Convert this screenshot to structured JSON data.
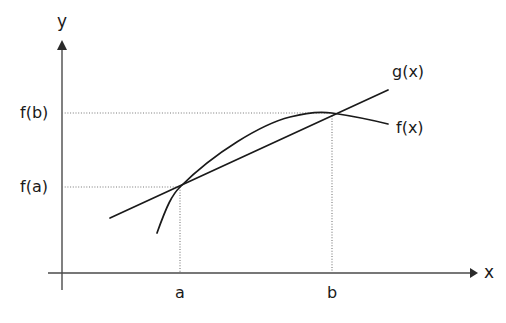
{
  "figure": {
    "background_color": "#ffffff",
    "line_color": "#1a1a1a",
    "axis_color": "#4a4a4a",
    "guide_color": "#787878"
  },
  "axes": {
    "x_label": "x",
    "y_label": "y",
    "x_axis": {
      "y": 273,
      "x_start": 48,
      "x_end": 478
    },
    "y_axis": {
      "x": 62,
      "y_start": 42,
      "y_end": 290
    }
  },
  "ticks": [
    {
      "name": "a",
      "label": "a",
      "x": 180,
      "label_x": 175,
      "label_y": 285
    },
    {
      "name": "b",
      "label": "b",
      "x": 332,
      "label_x": 327,
      "label_y": 285
    }
  ],
  "value_labels": [
    {
      "name": "f-of-a",
      "label": "f(a)",
      "y": 187,
      "label_x": 20,
      "label_y": 179
    },
    {
      "name": "f-of-b",
      "label": "f(b)",
      "y": 113,
      "label_x": 20,
      "label_y": 105
    }
  ],
  "guides": [
    {
      "name": "horizontal-guide-fa",
      "x1": 62,
      "y1": 187,
      "x2": 180,
      "y2": 187
    },
    {
      "name": "vertical-guide-a",
      "x1": 180,
      "y1": 187,
      "x2": 180,
      "y2": 273
    },
    {
      "name": "horizontal-guide-fb",
      "x1": 62,
      "y1": 113,
      "x2": 332,
      "y2": 113
    },
    {
      "name": "vertical-guide-b",
      "x1": 332,
      "y1": 113,
      "x2": 332,
      "y2": 273
    }
  ],
  "curves": [
    {
      "name": "function-curve-fx",
      "label": "f(x)",
      "label_x": 396,
      "label_y": 120,
      "path": "M 157 233 C 167 205 172 195 180 187 C 215 152 262 124 290 117 C 312 111 325 112 332 113 C 352 116 372 120 388 124"
    },
    {
      "name": "secant-line-gx",
      "label": "g(x)",
      "label_x": 392,
      "label_y": 64,
      "path": "M 110 218 L 388 90"
    }
  ],
  "chart_data": {
    "type": "line",
    "xlabel": "x",
    "ylabel": "y",
    "grid": false,
    "legend": "inline-labels-right",
    "xticks": [
      "a",
      "b"
    ],
    "yticks": [
      "f(a)",
      "f(b)"
    ],
    "annotations": [
      "f(x)",
      "g(x)"
    ],
    "series": [
      {
        "name": "f(x)",
        "description": "concave increasing curve passing through (a, f(a)) and (b, f(b))",
        "x": [
          157,
          180,
          215,
          250,
          290,
          332,
          360,
          388
        ],
        "y": [
          233,
          187,
          152,
          132,
          117,
          113,
          119,
          124
        ]
      },
      {
        "name": "g(x)",
        "description": "straight secant line through (a, f(a)) and (b, f(b))",
        "x": [
          110,
          180,
          332,
          388
        ],
        "y": [
          218,
          187,
          113,
          90
        ]
      }
    ],
    "key_points": [
      {
        "name": "a",
        "x": 180,
        "y": 187,
        "xlabel": "a",
        "ylabel": "f(a)"
      },
      {
        "name": "b",
        "x": 332,
        "y": 113,
        "xlabel": "b",
        "ylabel": "f(b)"
      }
    ]
  }
}
